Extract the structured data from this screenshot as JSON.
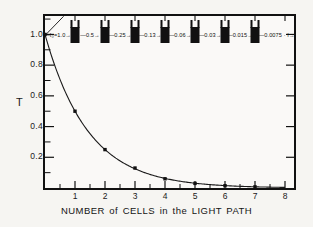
{
  "figure": {
    "caption": "NUMBER of CELLS in the LIGHT PATH",
    "ylabel": "T",
    "background_color": "#f6f5f2",
    "frame_color": "#111111",
    "curve_color": "#1a1a1a",
    "marker_color": "#111111"
  },
  "chart_data": {
    "type": "line",
    "title": "",
    "xlabel": "NUMBER of CELLS in the LIGHT PATH",
    "ylabel": "T",
    "x": [
      0,
      1,
      2,
      3,
      4,
      5,
      6,
      7
    ],
    "values": [
      1.0,
      0.5,
      0.25,
      0.13,
      0.06,
      0.03,
      0.015,
      0.0075
    ],
    "xlim": [
      0,
      8.3
    ],
    "ylim": [
      0,
      1.12
    ],
    "xticks": [
      1,
      2,
      3,
      4,
      5,
      6,
      7,
      8
    ],
    "xtick_labels": [
      "1",
      "2",
      "3",
      "4",
      "5",
      "6",
      "7",
      "8"
    ],
    "xticks_minor": [
      0.5,
      1.5,
      2.5,
      3.5,
      4.5,
      5.5,
      6.5,
      7.5
    ],
    "yticks": [
      0.2,
      0.4,
      0.6,
      0.8,
      1.0
    ],
    "ytick_labels": [
      "0.2",
      "0.4",
      "0.6",
      "0.8",
      "1.0"
    ],
    "yticks_minor": [
      0.1,
      0.3,
      0.5,
      0.7,
      0.9,
      1.1
    ],
    "grid": false,
    "legend": null,
    "markers": "square",
    "note": "Transmittance halves with each successive cell in the light path"
  },
  "cell_diagram": {
    "cuvette_count": 7,
    "cuvette_positions": [
      1,
      2,
      3,
      4,
      5,
      6,
      7
    ],
    "flux_labels": [
      {
        "text": "I₀=1.0",
        "at_x": 0.42
      },
      {
        "text": "0.5",
        "at_x": 1.5
      },
      {
        "text": "0.25",
        "at_x": 2.5
      },
      {
        "text": "0.13",
        "at_x": 3.5
      },
      {
        "text": "0.06",
        "at_x": 4.5
      },
      {
        "text": "0.03",
        "at_x": 5.5
      },
      {
        "text": "0.015",
        "at_x": 6.5
      },
      {
        "text": "0.0075 · I",
        "at_x": 7.72
      }
    ]
  }
}
